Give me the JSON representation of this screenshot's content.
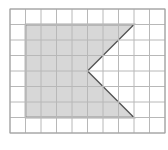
{
  "diagram": {
    "type": "grid-shape",
    "grid": {
      "columns": 10,
      "rows": 8,
      "origin_px": [
        10,
        9
      ],
      "cell_px": 15.5,
      "line_color": "#b8b8b8",
      "border_color": "#a0a0a0"
    },
    "shape": {
      "description": "Shaded pentagon (rectangle with triangular notch on right side)",
      "vertices_grid": [
        [
          1,
          1
        ],
        [
          8,
          1
        ],
        [
          5,
          4
        ],
        [
          8,
          7
        ],
        [
          1,
          7
        ]
      ],
      "fill_color": "#d0d0d0",
      "stroke_color": "#555555"
    }
  }
}
